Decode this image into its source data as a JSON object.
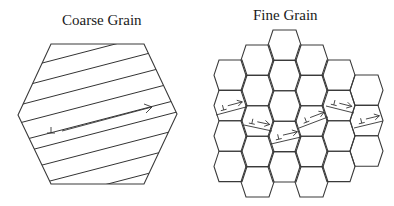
{
  "panels": {
    "coarse": {
      "title": "Coarse Grain",
      "grain_count": 1,
      "dislocation_symbol": "⊥",
      "description": "Single large hexagonal grain with parallel slip lines; long dislocation pile-up arrow"
    },
    "fine": {
      "title": "Fine Grain",
      "grain_count": 26,
      "dislocation_symbol": "⊥",
      "description": "Honeycomb of small hexagonal grains; short slip arrows blocked at grain boundaries"
    }
  },
  "colors": {
    "line": "#3a3a3a",
    "background": "#ffffff",
    "text": "#1a1a1a"
  }
}
